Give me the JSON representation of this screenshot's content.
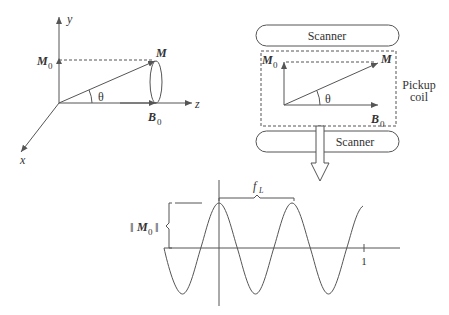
{
  "left_diagram": {
    "axes": {
      "x": "x",
      "y": "y",
      "z": "z"
    },
    "vector_label": "M",
    "projection_label_main": "M",
    "projection_label_sub": "0",
    "field_label_main": "B",
    "field_label_sub": "0",
    "angle_label": "θ"
  },
  "right_diagram": {
    "top_scanner_label": "Scanner",
    "bottom_scanner_label": "Scanner",
    "coil_label_line1": "Pickup",
    "coil_label_line2": "coil",
    "vector_label": "M",
    "projection_label_main": "M",
    "projection_label_sub": "0",
    "field_label_main": "B",
    "field_label_sub": "0",
    "angle_label": "θ"
  },
  "signal_plot": {
    "amplitude_label_main": "M",
    "amplitude_label_sub": "0",
    "amplitude_bars": "‖",
    "frequency_label_main": "f",
    "frequency_label_sub": "L",
    "tick_label": "1"
  },
  "colors": {
    "line": "#555555",
    "text": "#333333",
    "background": "#ffffff"
  }
}
